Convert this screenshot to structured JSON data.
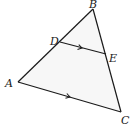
{
  "diagram": {
    "type": "triangle-with-parallel-segment",
    "fill_color": "#f7f7f7",
    "stroke_color": "#1a1a1a",
    "vertices": {
      "A": {
        "label": "A",
        "x": 18,
        "y": 82
      },
      "B": {
        "label": "B",
        "x": 93,
        "y": 9
      },
      "C": {
        "label": "C",
        "x": 121,
        "y": 112
      },
      "D": {
        "label": "D",
        "x": 60,
        "y": 42
      },
      "E": {
        "label": "E",
        "x": 106,
        "y": 54
      }
    },
    "segments": [
      {
        "from": "A",
        "to": "B"
      },
      {
        "from": "B",
        "to": "C"
      },
      {
        "from": "A",
        "to": "C",
        "arrow": true
      },
      {
        "from": "D",
        "to": "E",
        "arrow": true
      }
    ],
    "annotation": "DE parallel to AC"
  }
}
